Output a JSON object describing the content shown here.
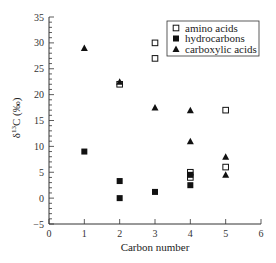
{
  "chart_data": {
    "type": "scatter",
    "title": "",
    "xlabel": "Carbon number",
    "ylabel": "δ13C (‰)",
    "ylabel_parts": {
      "delta": "δ",
      "sup": "13",
      "rest": "C (‰)"
    },
    "xlim": [
      0,
      6
    ],
    "ylim": [
      -5,
      35
    ],
    "xticks": [
      0,
      1,
      2,
      3,
      4,
      5,
      6
    ],
    "yticks": [
      -5,
      0,
      5,
      10,
      15,
      20,
      25,
      30,
      35
    ],
    "grid": false,
    "legend_position": "upper right",
    "series": [
      {
        "name": "amino acids",
        "marker": "open-square",
        "points": [
          [
            2,
            22
          ],
          [
            3,
            30
          ],
          [
            3,
            27
          ],
          [
            4,
            5
          ],
          [
            4,
            4
          ],
          [
            5,
            17
          ],
          [
            5,
            6
          ]
        ]
      },
      {
        "name": "hydrocarbons",
        "marker": "filled-square",
        "points": [
          [
            1,
            9
          ],
          [
            2,
            3.3
          ],
          [
            2,
            0
          ],
          [
            3,
            1.2
          ],
          [
            4,
            4.5
          ],
          [
            4,
            2.5
          ]
        ]
      },
      {
        "name": "carboxylic acids",
        "marker": "filled-triangle",
        "points": [
          [
            1,
            29
          ],
          [
            2,
            22.5
          ],
          [
            3,
            17.5
          ],
          [
            4,
            17
          ],
          [
            4,
            11
          ],
          [
            5,
            8
          ],
          [
            5,
            4.5
          ]
        ]
      }
    ]
  }
}
